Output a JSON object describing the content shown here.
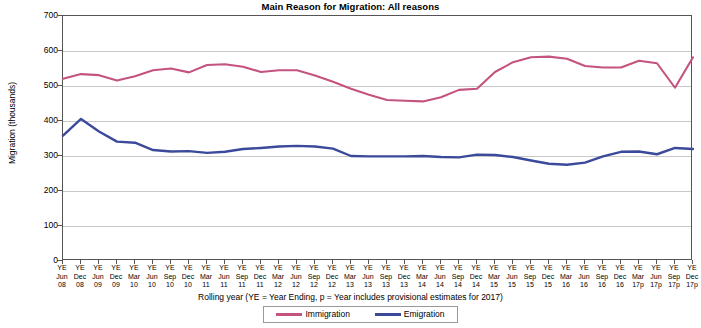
{
  "chart_data": {
    "type": "line",
    "title": "Main Reason for Migration: All reasons",
    "xlabel": "Rolling year (YE = Year Ending, p = Year includes provisional estimates for 2017)",
    "ylabel": "Migration (thousands)",
    "ylim": [
      0,
      700
    ],
    "ytick_labels": [
      "700",
      "600",
      "500",
      "400",
      "300",
      "200",
      "100",
      "0"
    ],
    "ytick_values": [
      700,
      600,
      500,
      400,
      300,
      200,
      100,
      0
    ],
    "grid": true,
    "legend_position": "bottom",
    "categories": [
      "YE Jun 08",
      "YE Dec 08",
      "YE Jun 09",
      "YE Dec 09",
      "YE Mar 10",
      "YE Jun 10",
      "YE Sep 10",
      "YE Dec 10",
      "YE Mar 11",
      "YE Jun 11",
      "YE Sep 11",
      "YE Dec 11",
      "YE Mar 12",
      "YE Jun 12",
      "YE Sep 12",
      "YE Dec 12",
      "YE Mar 13",
      "YE Jun 13",
      "YE Sep 13",
      "YE Dec 13",
      "YE Mar 14",
      "YE Jun 14",
      "YE Sep 14",
      "YE Dec 14",
      "YE Mar 15",
      "YE Jun 15",
      "YE Sep 15",
      "YE Dec 15",
      "YE Mar 16",
      "YE Jun 16",
      "YE Sep 16",
      "YE Dec 16",
      "YE Mar 17p",
      "YE Jun 17p",
      "YE Sep 17p",
      "YE Dec 17p"
    ],
    "tick_labels": [
      {
        "line1": "YE",
        "line2": "Jun",
        "line3": "08"
      },
      {
        "line1": "YE",
        "line2": "Dec",
        "line3": "08"
      },
      {
        "line1": "YE",
        "line2": "Jun",
        "line3": "09"
      },
      {
        "line1": "YE",
        "line2": "Dec",
        "line3": "09"
      },
      {
        "line1": "YE",
        "line2": "Mar",
        "line3": "10"
      },
      {
        "line1": "YE",
        "line2": "Jun",
        "line3": "10"
      },
      {
        "line1": "YE",
        "line2": "Sep",
        "line3": "10"
      },
      {
        "line1": "YE",
        "line2": "Dec",
        "line3": "10"
      },
      {
        "line1": "YE",
        "line2": "Mar",
        "line3": "11"
      },
      {
        "line1": "YE",
        "line2": "Jun",
        "line3": "11"
      },
      {
        "line1": "YE",
        "line2": "Sep",
        "line3": "11"
      },
      {
        "line1": "YE",
        "line2": "Dec",
        "line3": "11"
      },
      {
        "line1": "YE",
        "line2": "Mar",
        "line3": "12"
      },
      {
        "line1": "YE",
        "line2": "Jun",
        "line3": "12"
      },
      {
        "line1": "YE",
        "line2": "Sep",
        "line3": "12"
      },
      {
        "line1": "YE",
        "line2": "Dec",
        "line3": "12"
      },
      {
        "line1": "YE",
        "line2": "Mar",
        "line3": "13"
      },
      {
        "line1": "YE",
        "line2": "Jun",
        "line3": "13"
      },
      {
        "line1": "YE",
        "line2": "Sep",
        "line3": "13"
      },
      {
        "line1": "YE",
        "line2": "Dec",
        "line3": "13"
      },
      {
        "line1": "YE",
        "line2": "Mar",
        "line3": "14"
      },
      {
        "line1": "YE",
        "line2": "Jun",
        "line3": "14"
      },
      {
        "line1": "YE",
        "line2": "Sep",
        "line3": "14"
      },
      {
        "line1": "YE",
        "line2": "Dec",
        "line3": "14"
      },
      {
        "line1": "YE",
        "line2": "Mar",
        "line3": "15"
      },
      {
        "line1": "YE",
        "line2": "Jun",
        "line3": "15"
      },
      {
        "line1": "YE",
        "line2": "Sep",
        "line3": "15"
      },
      {
        "line1": "YE",
        "line2": "Dec",
        "line3": "15"
      },
      {
        "line1": "YE",
        "line2": "Mar",
        "line3": "16"
      },
      {
        "line1": "YE",
        "line2": "Jun",
        "line3": "16"
      },
      {
        "line1": "YE",
        "line2": "Sep",
        "line3": "16"
      },
      {
        "line1": "YE",
        "line2": "Dec",
        "line3": "16"
      },
      {
        "line1": "YE",
        "line2": "Mar",
        "line3": "17p"
      },
      {
        "line1": "YE",
        "line2": "Jun",
        "line3": "17p"
      },
      {
        "line1": "YE",
        "line2": "Sep",
        "line3": "17p"
      },
      {
        "line1": "YE",
        "line2": "Dec",
        "line3": "17p"
      }
    ],
    "series": [
      {
        "name": "Immigration",
        "color": "#c4537f",
        "values": [
          521,
          534,
          531,
          516,
          528,
          545,
          550,
          539,
          560,
          562,
          555,
          540,
          545,
          545,
          530,
          512,
          492,
          475,
          460,
          458,
          456,
          468,
          489,
          492,
          540,
          568,
          582,
          584,
          578,
          557,
          553,
          553,
          572,
          565,
          495,
          582
        ]
      },
      {
        "name": "Emigration",
        "color": "#3b4a9a",
        "values": [
          358,
          406,
          370,
          341,
          338,
          317,
          313,
          314,
          309,
          312,
          320,
          323,
          327,
          329,
          327,
          321,
          300,
          299,
          299,
          299,
          300,
          297,
          296,
          304,
          303,
          297,
          287,
          278,
          275,
          281,
          299,
          312,
          313,
          305,
          323,
          320
        ]
      }
    ]
  }
}
